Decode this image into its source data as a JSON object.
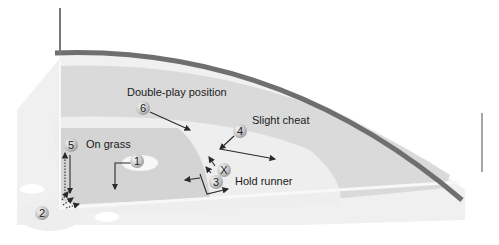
{
  "diagram": {
    "title": "",
    "colors": {
      "background": "#ffffff",
      "outfield_grass": "#dcdcdc",
      "infield_dirt": "#e9e9e9",
      "infield_grass": "#d6d6d6",
      "wall": "#6f6f6f",
      "foul_line": "#f7f7f7",
      "ball_fill": "#cfcfcf",
      "arrow": "#2a2a2a"
    },
    "annotations": [
      {
        "id": "double-play",
        "text": "Double-play position"
      },
      {
        "id": "slight-cheat",
        "text": "Slight cheat"
      },
      {
        "id": "on-grass",
        "text": "On grass"
      },
      {
        "id": "hold-runner",
        "text": "Hold runner"
      }
    ],
    "players": [
      {
        "id": "pitcher",
        "label": "1"
      },
      {
        "id": "catcher",
        "label": "2"
      },
      {
        "id": "first-base",
        "label": "3"
      },
      {
        "id": "second-base",
        "label": "4"
      },
      {
        "id": "third-base",
        "label": "5"
      },
      {
        "id": "shortstop",
        "label": "6"
      },
      {
        "id": "runner",
        "label": "X"
      }
    ]
  }
}
